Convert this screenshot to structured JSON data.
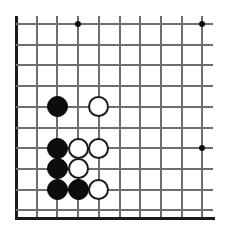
{
  "figure": {
    "kind": "go-board-diagram",
    "board_color": "#ffffff",
    "line_color": "#6e6e6e",
    "edge_color": "#1a1a1a",
    "black_stone_color": "#0d0d0d",
    "white_stone_color": "#ffffff",
    "white_stone_border_color": "#1a1a1a",
    "star_point_color": "#111111"
  },
  "board": {
    "visible_columns": 10,
    "visible_rows": 10,
    "origin_x": 16,
    "origin_y": 24,
    "spacing": 20.7,
    "overhang_right": 11,
    "overhang_top": 8,
    "bottom_edge_y": 217,
    "left_edge_x": 16,
    "stone_radius": 10.5
  },
  "star_points": [
    {
      "col": 4,
      "row": 1,
      "name": "hoshi-top-left"
    },
    {
      "col": 10,
      "row": 1,
      "name": "hoshi-top-right"
    },
    {
      "col": 10,
      "row": 7,
      "name": "hoshi-right-side"
    }
  ],
  "stones": [
    {
      "color": "black",
      "col": 3,
      "row": 5
    },
    {
      "color": "white",
      "col": 5,
      "row": 5
    },
    {
      "color": "black",
      "col": 3,
      "row": 7
    },
    {
      "color": "white",
      "col": 4,
      "row": 7
    },
    {
      "color": "white",
      "col": 5,
      "row": 7
    },
    {
      "color": "black",
      "col": 3,
      "row": 8
    },
    {
      "color": "white",
      "col": 4,
      "row": 8
    },
    {
      "color": "black",
      "col": 3,
      "row": 9
    },
    {
      "color": "black",
      "col": 4,
      "row": 9
    },
    {
      "color": "white",
      "col": 5,
      "row": 9
    }
  ],
  "counts": {
    "black_stones": 5,
    "white_stones": 5,
    "total_stones": 10
  }
}
